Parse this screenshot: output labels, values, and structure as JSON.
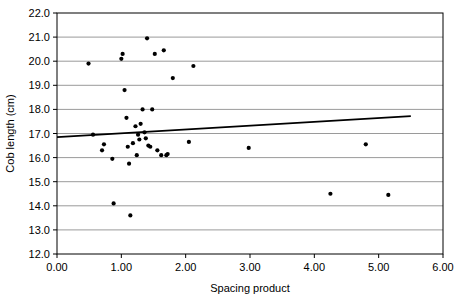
{
  "chart_data": {
    "type": "scatter",
    "title": "",
    "xlabel": "Spacing product",
    "ylabel": "Cob length (cm)",
    "xlim": [
      0.0,
      6.0
    ],
    "ylim": [
      12.0,
      22.0
    ],
    "xticks": [
      "0.00",
      "1.00",
      "2.00",
      "3.00",
      "4.00",
      "5.00",
      "6.00"
    ],
    "yticks": [
      "12.0",
      "13.0",
      "14.0",
      "15.0",
      "16.0",
      "17.0",
      "18.0",
      "19.0",
      "20.0",
      "21.0",
      "22.0"
    ],
    "grid": "horizontal",
    "legend": "none",
    "marker_color": "#000000",
    "trendline_color": "#000000",
    "axis_color": "#000000",
    "grid_color": "#808080",
    "points": [
      [
        0.49,
        19.9
      ],
      [
        0.56,
        16.95
      ],
      [
        0.7,
        16.3
      ],
      [
        0.73,
        16.55
      ],
      [
        0.86,
        15.95
      ],
      [
        0.88,
        14.1
      ],
      [
        1.02,
        20.3
      ],
      [
        1.0,
        20.1
      ],
      [
        1.05,
        18.8
      ],
      [
        1.08,
        17.65
      ],
      [
        1.1,
        16.45
      ],
      [
        1.12,
        15.75
      ],
      [
        1.14,
        13.6
      ],
      [
        1.18,
        16.6
      ],
      [
        1.22,
        17.3
      ],
      [
        1.24,
        16.1
      ],
      [
        1.26,
        16.95
      ],
      [
        1.28,
        16.75
      ],
      [
        1.3,
        17.4
      ],
      [
        1.33,
        18.0
      ],
      [
        1.36,
        17.05
      ],
      [
        1.38,
        16.8
      ],
      [
        1.4,
        20.95
      ],
      [
        1.42,
        16.5
      ],
      [
        1.45,
        16.45
      ],
      [
        1.48,
        18.0
      ],
      [
        1.52,
        20.3
      ],
      [
        1.56,
        16.3
      ],
      [
        1.62,
        16.1
      ],
      [
        1.66,
        20.45
      ],
      [
        1.7,
        16.1
      ],
      [
        1.72,
        16.15
      ],
      [
        1.8,
        19.3
      ],
      [
        2.05,
        16.65
      ],
      [
        2.12,
        19.8
      ],
      [
        2.98,
        16.4
      ],
      [
        4.25,
        14.5
      ],
      [
        4.8,
        16.55
      ],
      [
        5.15,
        14.45
      ]
    ],
    "trendline": {
      "x_start": 0.0,
      "y_start": 16.85,
      "x_end": 5.5,
      "y_end": 17.72
    }
  }
}
